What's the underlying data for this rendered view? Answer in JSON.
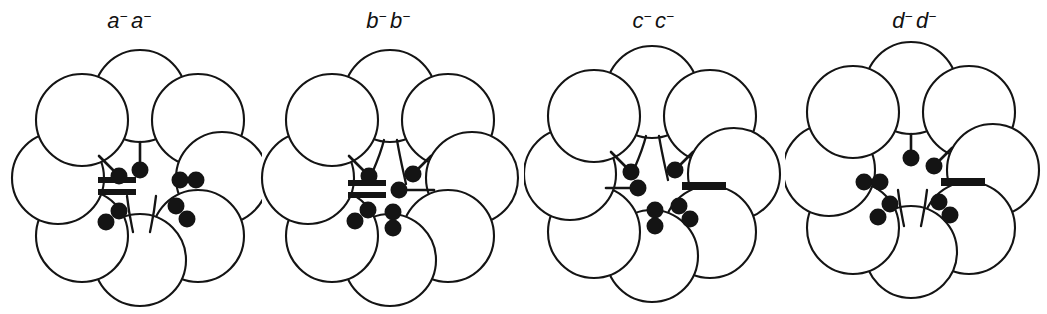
{
  "figure": {
    "kind": "schematic-diagram",
    "background_color": "#ffffff",
    "ink_color": "#141414",
    "panel_count": 4
  },
  "panels": [
    {
      "id": "panel-a",
      "label_main": "a",
      "label_sup": "−",
      "label_text": "a− a−",
      "genotype": "a-a-",
      "cell_count": 8,
      "features": {
        "fork_position": "bottom",
        "fork_opens": "upward",
        "double_bar": true,
        "double_bar_side": "left",
        "single_bar": false,
        "stalk_count": 2,
        "free_dot_count": 6
      }
    },
    {
      "id": "panel-b",
      "label_main": "b",
      "label_sup": "−",
      "label_text": "b− b−",
      "genotype": "b-b-",
      "cell_count": 8,
      "features": {
        "fork_position": "top",
        "fork_opens": "downward",
        "double_bar": true,
        "double_bar_side": "left",
        "single_bar": false,
        "stalk_count": 3,
        "free_dot_count": 4
      }
    },
    {
      "id": "panel-c",
      "label_main": "c",
      "label_sup": "−",
      "label_text": "c− c−",
      "genotype": "c-c-",
      "cell_count": 8,
      "features": {
        "fork_position": "top",
        "fork_opens": "downward",
        "double_bar": false,
        "single_bar": true,
        "single_bar_side": "right",
        "stalk_count": 3,
        "free_dot_count": 4
      }
    },
    {
      "id": "panel-d",
      "label_main": "d",
      "label_sup": "−",
      "label_text": "d− d−",
      "genotype": "d-d-",
      "cell_count": 8,
      "features": {
        "fork_position": "bottom",
        "fork_opens": "upward",
        "double_bar": false,
        "single_bar": true,
        "single_bar_side": "right",
        "stalk_count": 2,
        "free_dot_count": 6
      }
    }
  ],
  "legend_keys": {
    "cell": "open-circle",
    "dot": "filled-circle",
    "stalk": "line-with-terminal-dot",
    "double_bar": "double-thick-bar",
    "single_bar": "single-thick-bar",
    "fork": "y-shaped-fork"
  }
}
